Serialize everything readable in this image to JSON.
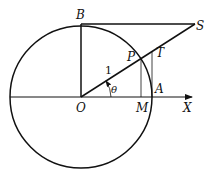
{
  "diagram": {
    "labels": {
      "B": "B",
      "S": "S",
      "P": "P",
      "T": "T",
      "O": "O",
      "M": "M",
      "A": "A",
      "X": "X",
      "radius": "1",
      "angle": "θ"
    },
    "colors": {
      "stroke": "#111111",
      "background": "#ffffff"
    }
  }
}
